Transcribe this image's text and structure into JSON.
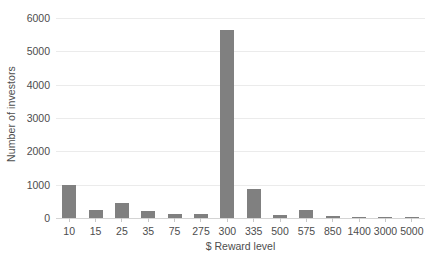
{
  "chart_data": {
    "type": "bar",
    "title": "",
    "subtitle": "",
    "xlabel": "$ Reward level",
    "ylabel": "Number of investors",
    "categories": [
      "10",
      "15",
      "25",
      "35",
      "75",
      "275",
      "300",
      "335",
      "500",
      "575",
      "850",
      "1400",
      "3000",
      "5000"
    ],
    "values": [
      1000,
      230,
      450,
      200,
      130,
      120,
      5650,
      860,
      80,
      230,
      60,
      30,
      25,
      30
    ],
    "series": [
      {
        "name": "Number of investors",
        "values": [
          1000,
          230,
          450,
          200,
          130,
          120,
          5650,
          860,
          80,
          230,
          60,
          30,
          25,
          30
        ]
      }
    ],
    "ylim": [
      0,
      6000
    ],
    "yticks": [
      0,
      1000,
      2000,
      3000,
      4000,
      5000,
      6000
    ],
    "ytick_labels": [
      "0",
      "1000",
      "2000",
      "3000",
      "4000",
      "5000",
      "6000"
    ],
    "grid": true,
    "grid_axis": "y",
    "legend": false,
    "legend_position": "none",
    "bar_color": "#808080",
    "gridline_color": "#ebebeb",
    "axis_text_color": "#4d4d4d",
    "background_color": "#ffffff"
  }
}
